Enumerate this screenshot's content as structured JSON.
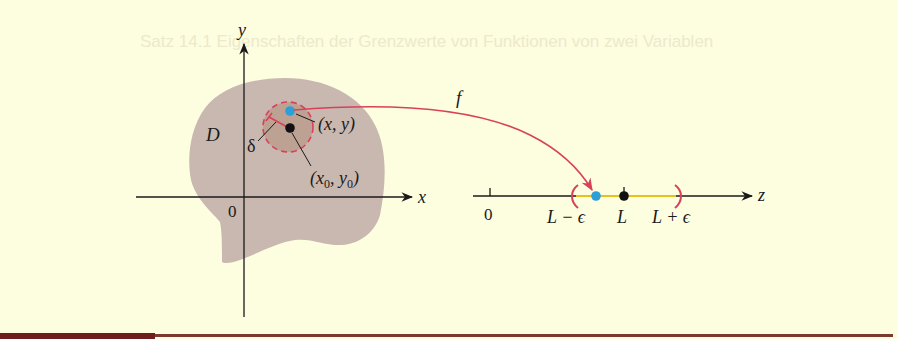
{
  "figure": {
    "background_color": "#fdfde0",
    "bleed_through_text": "Satz 14.1  Eigenschaften der Grenzwerte von Funktionen von zwei Variablen",
    "domain_plot": {
      "x_axis_label": "x",
      "y_axis_label": "y",
      "origin_label": "0",
      "region_label": "D",
      "radius_label": "δ",
      "point_label": "(x, y)",
      "center_label_base_x": "x",
      "center_label_sub_x": "0",
      "center_label_base_y": "y",
      "center_label_sub_y": "0",
      "region_color": "#c9b8b0",
      "disk_color": "#b89a88",
      "point_color": "#2a9fd8",
      "center_color": "#111111",
      "circle_color": "#d9405a"
    },
    "mapping": {
      "label": "f",
      "arrow_color": "#d9405a"
    },
    "range_line": {
      "axis_label": "z",
      "origin_label": "0",
      "lower_label": "L − ϵ",
      "center_label": "L",
      "upper_label": "L + ϵ",
      "interval_color": "#e8c020",
      "bracket_color": "#d9405a",
      "image_point_color": "#2a9fd8",
      "limit_point_color": "#111111"
    }
  },
  "rules": {
    "thick_color": "#6e1c1c",
    "thin_color": "#7a3a30"
  }
}
